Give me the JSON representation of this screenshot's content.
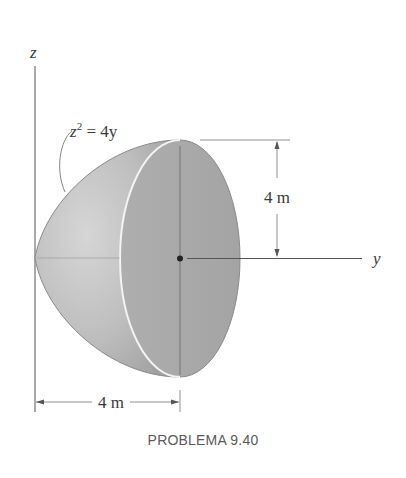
{
  "figure": {
    "axes": {
      "z_label": "z",
      "y_label": "y"
    },
    "equation": {
      "lhs_var": "z",
      "exponent": "2",
      "rest": " = 4y"
    },
    "dimensions": {
      "height_label": "4 m",
      "length_label": "4 m"
    },
    "shape": {
      "type": "paraboloid of revolution",
      "fill_side": "#b9b9b9",
      "fill_face": "#a9a9a9",
      "edge_color": "#8a8a8a",
      "rim_highlight": "#f2f2f2"
    },
    "colors": {
      "line": "#555555",
      "text": "#3a3a3a"
    }
  },
  "caption": "PROBLEMA 9.40"
}
